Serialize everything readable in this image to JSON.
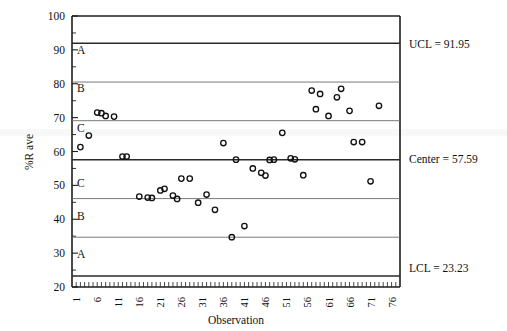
{
  "chart_data": {
    "type": "scatter",
    "title": "",
    "xlabel": "Observation",
    "ylabel": "%R ave",
    "xlim": [
      0,
      78
    ],
    "ylim": [
      20,
      100
    ],
    "grid": false,
    "legend": "none",
    "ytick_labels": [
      "100",
      "90",
      "80",
      "70",
      "60",
      "50",
      "40",
      "30",
      "20"
    ],
    "ytick_values": [
      100,
      90,
      80,
      70,
      60,
      50,
      40,
      30,
      20
    ],
    "yminor_step": 5,
    "xtick_labels": [
      "1",
      "6",
      "11",
      "16",
      "21",
      "26",
      "31",
      "36",
      "41",
      "46",
      "51",
      "56",
      "61",
      "66",
      "71",
      "76"
    ],
    "xtick_values": [
      1,
      6,
      11,
      16,
      21,
      26,
      31,
      36,
      41,
      46,
      51,
      56,
      61,
      66,
      71,
      76
    ],
    "control_limits": {
      "ucl": 91.95,
      "center": 57.59,
      "lcl": 23.23,
      "ucl_label": "UCL = 91.95",
      "center_label": "Center = 57.59",
      "lcl_label": "LCL = 23.23"
    },
    "zone_boundaries": [
      80.5,
      69.1,
      46.1,
      34.7
    ],
    "zone_labels_upper": [
      "A",
      "B",
      "C"
    ],
    "zone_labels_lower": [
      "C",
      "B",
      "A"
    ],
    "zone_label_values": {
      "upper_a": 90.0,
      "upper_b": 78.6,
      "upper_c": 67.0,
      "lower_c": 50.6,
      "lower_b": 41.0,
      "lower_a": 29.6
    },
    "series": [
      {
        "name": "%R ave",
        "x": [
          2,
          4,
          6,
          7,
          8,
          10,
          12,
          13,
          16,
          18,
          19,
          21,
          22,
          24,
          25,
          26,
          28,
          30,
          32,
          34,
          36,
          38,
          39,
          41,
          43,
          45,
          46,
          47,
          48,
          50,
          52,
          53,
          55,
          57,
          58,
          59,
          61,
          63,
          64,
          66,
          67,
          69,
          71,
          73
        ],
        "values": [
          61.3,
          64.7,
          71.5,
          71.3,
          70.5,
          70.3,
          58.5,
          58.5,
          46.7,
          46.4,
          46.3,
          48.5,
          49.0,
          47.0,
          46.0,
          52.0,
          52.0,
          44.9,
          47.3,
          42.8,
          62.5,
          34.7,
          57.6,
          38.0,
          55.0,
          53.7,
          52.9,
          57.5,
          57.6,
          65.5,
          58.0,
          57.7,
          53.0,
          78.0,
          72.5,
          77.0,
          70.5,
          76.0,
          78.5,
          72.0,
          62.8,
          62.8,
          51.2,
          73.5
        ]
      }
    ]
  },
  "figure": {
    "y_axis_title": "%R ave",
    "x_axis_title": "Observation"
  }
}
